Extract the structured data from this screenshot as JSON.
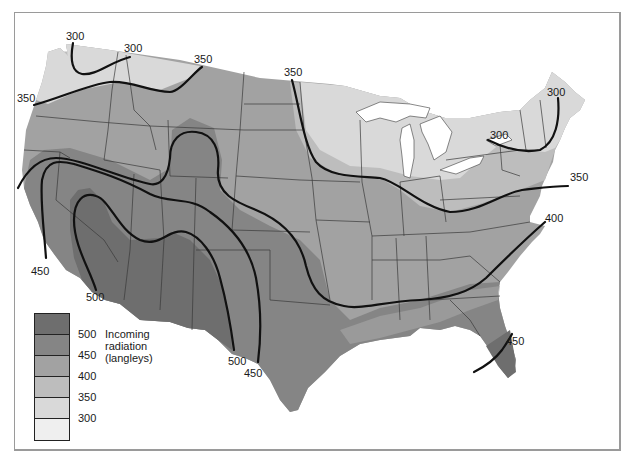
{
  "map": {
    "title": "Incoming radiation",
    "units": "(langleys)",
    "region": "Contiguous United States"
  },
  "legend": {
    "title": "Incoming radiation",
    "units": "(langleys)",
    "items": [
      {
        "value": "500",
        "color": "#6e6e6e"
      },
      {
        "value": "450",
        "color": "#858585"
      },
      {
        "value": "400",
        "color": "#a2a2a2"
      },
      {
        "value": "350",
        "color": "#bdbdbd"
      },
      {
        "value": "300",
        "color": "#d9d9d9"
      },
      {
        "value": "",
        "color": "#efefef"
      }
    ]
  },
  "contour_labels": [
    {
      "id": "nw-300-a",
      "text": "300",
      "x": 66,
      "y": 31
    },
    {
      "id": "nw-300-b",
      "text": "300",
      "x": 124,
      "y": 43
    },
    {
      "id": "nw-350-a",
      "text": "350",
      "x": 194,
      "y": 54
    },
    {
      "id": "w-350",
      "text": "350",
      "x": 17,
      "y": 93
    },
    {
      "id": "nd-350",
      "text": "350",
      "x": 284,
      "y": 67
    },
    {
      "id": "me-300",
      "text": "300",
      "x": 547,
      "y": 87
    },
    {
      "id": "ny-300",
      "text": "300",
      "x": 490,
      "y": 130
    },
    {
      "id": "ne-350",
      "text": "350",
      "x": 570,
      "y": 172
    },
    {
      "id": "va-400",
      "text": "400",
      "x": 545,
      "y": 213
    },
    {
      "id": "ca-450",
      "text": "450",
      "x": 31,
      "y": 266
    },
    {
      "id": "az-500",
      "text": "500",
      "x": 86,
      "y": 292
    },
    {
      "id": "tx-500",
      "text": "500",
      "x": 228,
      "y": 356
    },
    {
      "id": "tx-450",
      "text": "450",
      "x": 244,
      "y": 368
    },
    {
      "id": "fl-450",
      "text": "450",
      "x": 506,
      "y": 336
    }
  ],
  "colors": {
    "zone_500": "#6e6e6e",
    "zone_450": "#858585",
    "zone_400": "#a2a2a2",
    "zone_350": "#bdbdbd",
    "zone_300": "#d9d9d9",
    "water": "#ffffff",
    "contour": "#111111",
    "border": "#3a3a3a"
  }
}
